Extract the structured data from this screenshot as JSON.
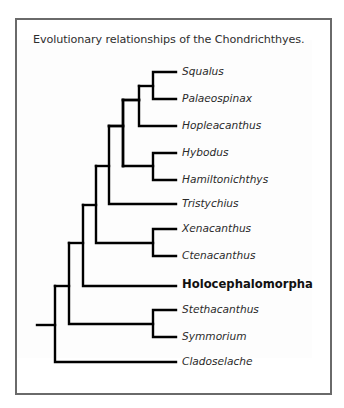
{
  "figure": {
    "title": "Evolutionary relationships of the Chondrichthyes.",
    "type": "cladogram",
    "line_color": "#000000",
    "border_color": "#6a6a6a",
    "text_color": "#2a2a2a"
  },
  "taxa": [
    {
      "id": "squalus",
      "label": "Squalus",
      "emphasis": false,
      "y": 72
    },
    {
      "id": "palaeospinax",
      "label": "Palaeospinax",
      "emphasis": false,
      "y": 99
    },
    {
      "id": "hopleacanthus",
      "label": "Hopleacanthus",
      "emphasis": false,
      "y": 126
    },
    {
      "id": "hybodus",
      "label": "Hybodus",
      "emphasis": false,
      "y": 153
    },
    {
      "id": "hamiltonichthys",
      "label": "Hamiltonichthys",
      "emphasis": false,
      "y": 180
    },
    {
      "id": "tristychius",
      "label": "Tristychius",
      "emphasis": false,
      "y": 204
    },
    {
      "id": "xenacanthus",
      "label": "Xenacanthus",
      "emphasis": false,
      "y": 229
    },
    {
      "id": "ctenacanthus",
      "label": "Ctenacanthus",
      "emphasis": false,
      "y": 256
    },
    {
      "id": "holocephalomorpha",
      "label": "Holocephalomorpha",
      "emphasis": true,
      "y": 286
    },
    {
      "id": "stethacanthus",
      "label": "Stethacanthus",
      "emphasis": false,
      "y": 310
    },
    {
      "id": "symmorium",
      "label": "Symmorium",
      "emphasis": false,
      "y": 337
    },
    {
      "id": "cladoselache",
      "label": "Cladoselache",
      "emphasis": false,
      "y": 362
    }
  ],
  "topology": "(Cladoselache,((Stethacanthus,Symmorium),(Holocephalomorpha,((Xenacanthus,Ctenacanthus),(Tristychius,((Hybodus,Hamiltonichthys),(Hopleacanthus,(Squalus,Palaeospinax))))))))"
}
